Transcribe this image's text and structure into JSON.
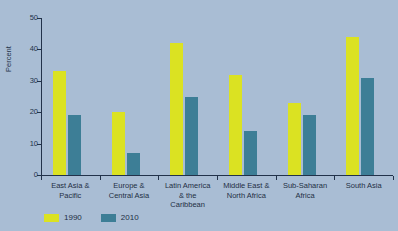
{
  "chart_data": {
    "type": "bar",
    "title": "",
    "xlabel": "",
    "ylabel": "Percent",
    "ylim": [
      0,
      50
    ],
    "yticks": [
      0,
      10,
      20,
      30,
      40,
      50
    ],
    "grid": false,
    "legend_position": "bottom-left",
    "categories": [
      "East Asia &\nPacific",
      "Europe &\nCentral Asia",
      "Latin America\n& the\nCaribbean",
      "Middle East &\nNorth Africa",
      "Sub-Saharan\nAfrica",
      "South Asia"
    ],
    "series": [
      {
        "name": "1990",
        "color": "#dbe222",
        "values": [
          33,
          20,
          42,
          32,
          23,
          44
        ]
      },
      {
        "name": "2010",
        "color": "#3d7e96",
        "values": [
          19,
          7,
          25,
          14,
          19,
          31
        ]
      }
    ]
  },
  "axis": {
    "y_title": "Percent",
    "y_tick_labels": [
      "0",
      "10",
      "20",
      "30",
      "40",
      "50"
    ]
  },
  "categories": [
    {
      "line1": "East Asia &",
      "line2": "Pacific",
      "line3": ""
    },
    {
      "line1": "Europe &",
      "line2": "Central Asia",
      "line3": ""
    },
    {
      "line1": "Latin America",
      "line2": "& the",
      "line3": "Caribbean"
    },
    {
      "line1": "Middle East &",
      "line2": "North Africa",
      "line3": ""
    },
    {
      "line1": "Sub-Saharan",
      "line2": "Africa",
      "line3": ""
    },
    {
      "line1": "South Asia",
      "line2": "",
      "line3": ""
    }
  ],
  "legend": [
    {
      "label": "1990"
    },
    {
      "label": "2010"
    }
  ],
  "colors": {
    "background": "#a9bdd4",
    "series_1990": "#dbe222",
    "series_2010": "#3d7e96",
    "axis": "#22324a",
    "text": "#1f2f44"
  }
}
